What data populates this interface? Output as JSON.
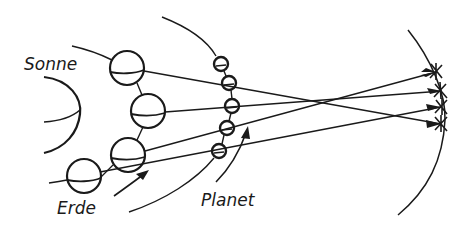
{
  "diagram": {
    "labels": {
      "sun": "Sonne",
      "earth": "Erde",
      "planet": "Planet"
    },
    "colors": {
      "ink": "#1a1a1a",
      "background": "#ffffff"
    },
    "earth_positions": [
      [
        127,
        68
      ],
      [
        148,
        111
      ],
      [
        128,
        155
      ],
      [
        84,
        176
      ]
    ],
    "planet_positions": [
      [
        221,
        64
      ],
      [
        229,
        83
      ],
      [
        232,
        106
      ],
      [
        227,
        128
      ],
      [
        219,
        151
      ]
    ],
    "star_positions": [
      [
        436,
        71
      ],
      [
        440,
        91
      ],
      [
        442,
        107
      ],
      [
        441,
        124
      ]
    ]
  }
}
